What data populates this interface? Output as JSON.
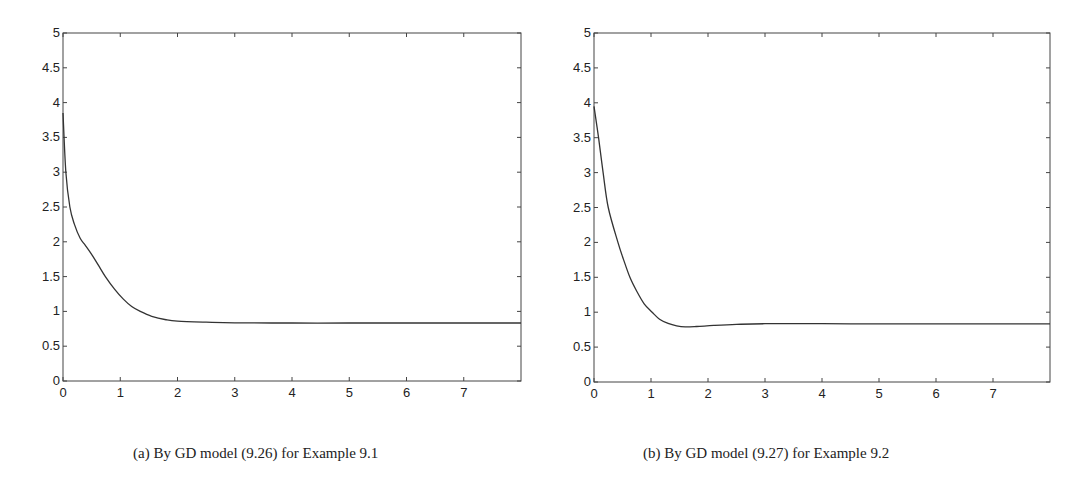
{
  "chart_data": [
    {
      "type": "line",
      "title": "",
      "caption": "(a) By GD model (9.26) for Example 9.1",
      "xlabel": "",
      "ylabel": "",
      "xlim": [
        0,
        8
      ],
      "ylim": [
        0,
        5
      ],
      "xticks": [
        0,
        1,
        2,
        3,
        4,
        5,
        6,
        7
      ],
      "yticks": [
        0,
        0.5,
        1,
        1.5,
        2,
        2.5,
        3,
        3.5,
        4,
        4.5,
        5
      ],
      "ytick_labels": [
        "0",
        "0.5",
        "1",
        "1.5",
        "2",
        "2.5",
        "3",
        "3.5",
        "4",
        "4.5",
        "5"
      ],
      "grid": false,
      "series": [
        {
          "name": "trajectory",
          "x": [
            0,
            0.05,
            0.12,
            0.2,
            0.3,
            0.39,
            0.5,
            0.62,
            0.74,
            0.9,
            1.05,
            1.2,
            1.35,
            1.55,
            1.8,
            2.0,
            2.5,
            3.0,
            4.0,
            5.0,
            6.0,
            7.0,
            8.0
          ],
          "values": [
            3.85,
            3.0,
            2.5,
            2.25,
            2.05,
            1.95,
            1.82,
            1.66,
            1.5,
            1.32,
            1.18,
            1.07,
            1.0,
            0.93,
            0.88,
            0.86,
            0.845,
            0.835,
            0.833,
            0.833,
            0.833,
            0.833,
            0.833
          ]
        }
      ]
    },
    {
      "type": "line",
      "title": "",
      "caption": "(b) By GD model (9.27) for Example 9.2",
      "xlabel": "",
      "ylabel": "",
      "xlim": [
        0,
        8
      ],
      "ylim": [
        0,
        5
      ],
      "xticks": [
        0,
        1,
        2,
        3,
        4,
        5,
        6,
        7
      ],
      "yticks": [
        0,
        0.5,
        1,
        1.5,
        2,
        2.5,
        3,
        3.5,
        4,
        4.5,
        5
      ],
      "ytick_labels": [
        "0",
        "0.5",
        "1",
        "1.5",
        "2",
        "2.5",
        "3",
        "3.5",
        "4",
        "4.5",
        "5"
      ],
      "grid": false,
      "series": [
        {
          "name": "trajectory",
          "x": [
            0,
            0.08,
            0.16,
            0.25,
            0.42,
            0.52,
            0.63,
            0.75,
            0.88,
            1.02,
            1.15,
            1.3,
            1.45,
            1.6,
            1.8,
            2.1,
            2.5,
            3.0,
            4.0,
            5.0,
            6.0,
            7.0,
            8.0
          ],
          "values": [
            3.95,
            3.5,
            3.0,
            2.5,
            2.0,
            1.75,
            1.5,
            1.3,
            1.12,
            1.0,
            0.9,
            0.84,
            0.805,
            0.79,
            0.795,
            0.81,
            0.825,
            0.835,
            0.835,
            0.833,
            0.833,
            0.833,
            0.833
          ]
        }
      ]
    }
  ]
}
